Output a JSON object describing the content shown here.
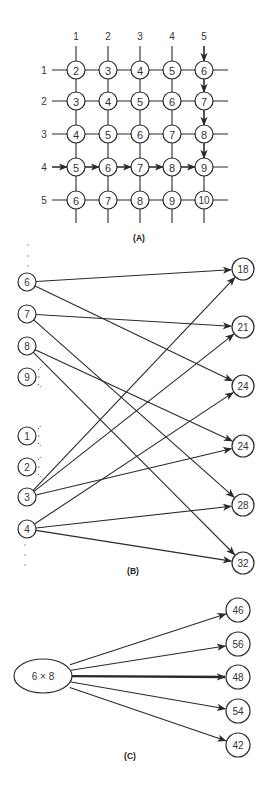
{
  "panel_a": {
    "caption": "(A)",
    "column_labels": [
      "1",
      "2",
      "3",
      "4",
      "5"
    ],
    "row_labels": [
      "1",
      "2",
      "3",
      "4",
      "5"
    ],
    "grid_values": [
      [
        "2",
        "3",
        "4",
        "5",
        "6"
      ],
      [
        "3",
        "4",
        "5",
        "6",
        "7"
      ],
      [
        "4",
        "5",
        "6",
        "7",
        "8"
      ],
      [
        "5",
        "6",
        "7",
        "8",
        "9"
      ],
      [
        "6",
        "7",
        "8",
        "9",
        "10"
      ]
    ],
    "highlighted_row": 4,
    "highlighted_column": 5,
    "description": "Addition table grid; arrows along row 4 and down column 5 converge at 9"
  },
  "panel_b": {
    "caption": "(B)",
    "left_nodes": [
      {
        "id": "6",
        "y": 282
      },
      {
        "id": "7",
        "y": 314
      },
      {
        "id": "8",
        "y": 346
      },
      {
        "id": "9",
        "y": 377,
        "fan_out": true
      },
      {
        "id": "1",
        "y": 436,
        "fan_out": true
      },
      {
        "id": "2",
        "y": 467,
        "fan_out": true
      },
      {
        "id": "3",
        "y": 497
      },
      {
        "id": "4",
        "y": 529
      }
    ],
    "right_nodes": [
      {
        "id": "18",
        "y": 269
      },
      {
        "id": "21",
        "y": 327
      },
      {
        "id": "24a",
        "label": "24",
        "y": 386
      },
      {
        "id": "24b",
        "label": "24",
        "y": 446
      },
      {
        "id": "28",
        "y": 505
      },
      {
        "id": "32",
        "y": 563
      }
    ],
    "edges": [
      [
        "6",
        "18"
      ],
      [
        "6",
        "24a"
      ],
      [
        "7",
        "21"
      ],
      [
        "7",
        "28"
      ],
      [
        "8",
        "24b"
      ],
      [
        "8",
        "32"
      ],
      [
        "3",
        "18"
      ],
      [
        "3",
        "21"
      ],
      [
        "3",
        "24b"
      ],
      [
        "4",
        "24a"
      ],
      [
        "4",
        "28"
      ],
      [
        "4",
        "32"
      ]
    ]
  },
  "panel_c": {
    "caption": "(C)",
    "problem": "6 × 8",
    "candidates": [
      "46",
      "56",
      "48",
      "54",
      "42"
    ],
    "strongest": "48"
  }
}
